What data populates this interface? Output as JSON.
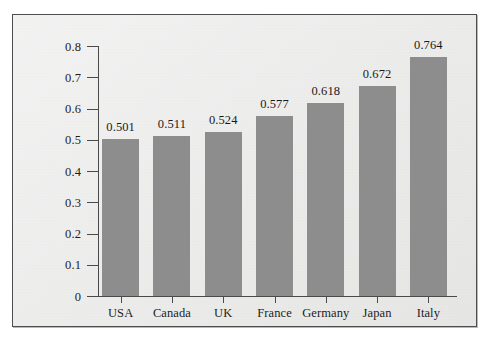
{
  "chart_data": {
    "type": "bar",
    "title": "",
    "subtitle": "",
    "xlabel": "",
    "ylabel": "Book debt/asset ratio",
    "categories": [
      "USA",
      "Canada",
      "UK",
      "France",
      "Germany",
      "Japan",
      "Italy"
    ],
    "values": [
      0.501,
      0.511,
      0.524,
      0.577,
      0.618,
      0.672,
      0.764
    ],
    "value_labels": [
      "0.501",
      "0.511",
      "0.524",
      "0.577",
      "0.618",
      "0.672",
      "0.764"
    ],
    "ylim": [
      0,
      0.8
    ],
    "ytick_labels": [
      "0",
      "0.1",
      "0.2",
      "0.3",
      "0.4",
      "0.5",
      "0.6",
      "0.7",
      "0.8"
    ],
    "ytick_values": [
      0,
      0.1,
      0.2,
      0.3,
      0.4,
      0.5,
      0.6,
      0.7,
      0.8
    ],
    "grid": false,
    "legend": null,
    "series": [
      {
        "name": "Book debt/asset ratio",
        "values": [
          0.501,
          0.511,
          0.524,
          0.577,
          0.618,
          0.672,
          0.764
        ]
      }
    ]
  },
  "style": {
    "bar_color": "#8d8d8d",
    "axis_color": "#4a4a4a",
    "text_color": "#1a1a1a",
    "panel_background": "#ececeb",
    "frame_border": "#4e4e4e"
  }
}
